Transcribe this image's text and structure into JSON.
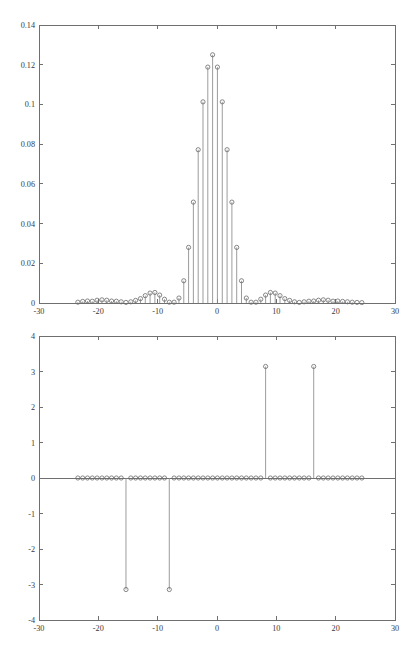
{
  "figure": {
    "name": "two-panel-stem-plot",
    "background": "#ffffff",
    "line_color": "#8a8a8a",
    "marker_color": "#6a6a6a",
    "axis_color": "#6f6f6f",
    "text_color": "#3a3a3a"
  },
  "chart_data": [
    {
      "type": "scatter",
      "plot_style": "stem",
      "title": "",
      "xlabel": "",
      "ylabel": "",
      "xlim": [
        -30,
        30
      ],
      "ylim": [
        0,
        0.14
      ],
      "grid": false,
      "legend": null,
      "xticks": [
        -30,
        -20,
        -10,
        0,
        10,
        20,
        30
      ],
      "xtick_labels": [
        "-30",
        "-20",
        "-10",
        "0",
        "10",
        "20",
        "30"
      ],
      "yticks": [
        0,
        0.02,
        0.04,
        0.06,
        0.08,
        0.1,
        0.12,
        0.14
      ],
      "ytick_labels": [
        "0",
        "0.02",
        "0.04",
        "0.06",
        "0.08",
        "0.1",
        "0.12",
        "0.14"
      ],
      "x": [
        -23.45,
        -22.64,
        -21.83,
        -21.02,
        -20.21,
        -19.39,
        -18.58,
        -17.77,
        -16.96,
        -16.15,
        -15.34,
        -14.53,
        -13.72,
        -12.9,
        -12.09,
        -11.28,
        -10.47,
        -9.66,
        -8.85,
        -8.04,
        -7.23,
        -6.41,
        -5.6,
        -4.79,
        -3.98,
        -3.17,
        -2.36,
        -1.55,
        -0.74,
        0.07,
        0.89,
        1.7,
        2.51,
        3.32,
        4.13,
        4.94,
        5.75,
        6.56,
        7.38,
        8.19,
        9.0,
        9.81,
        10.62,
        11.43,
        12.24,
        13.06,
        13.87,
        14.68,
        15.49,
        16.3,
        17.11,
        17.92,
        18.73,
        19.55,
        20.36,
        21.17,
        21.98,
        22.79,
        23.6,
        24.41
      ],
      "y": [
        0.0004,
        0.0008,
        0.001,
        0.0009,
        0.0014,
        0.0016,
        0.0014,
        0.001,
        0.0009,
        0.0006,
        0.0003,
        0.0006,
        0.0013,
        0.0022,
        0.0037,
        0.005,
        0.0053,
        0.004,
        0.0019,
        0.0004,
        0.0004,
        0.0025,
        0.0112,
        0.028,
        0.0508,
        0.0772,
        0.1013,
        0.1188,
        0.125,
        0.1188,
        0.1013,
        0.0772,
        0.0508,
        0.028,
        0.0112,
        0.0025,
        0.0004,
        0.0004,
        0.0019,
        0.004,
        0.0053,
        0.005,
        0.0037,
        0.0022,
        0.0013,
        0.0006,
        0.0003,
        0.0006,
        0.0009,
        0.001,
        0.0014,
        0.0016,
        0.0014,
        0.0009,
        0.001,
        0.0008,
        0.0006,
        0.0004,
        0.0003,
        0.0002
      ]
    },
    {
      "type": "scatter",
      "plot_style": "stem",
      "title": "",
      "xlabel": "",
      "ylabel": "",
      "xlim": [
        -30,
        30
      ],
      "ylim": [
        -4,
        4
      ],
      "grid": false,
      "legend": null,
      "xticks": [
        -30,
        -20,
        -10,
        0,
        10,
        20,
        30
      ],
      "xtick_labels": [
        "-30",
        "-20",
        "-10",
        "0",
        "10",
        "20",
        "30"
      ],
      "yticks": [
        -4,
        -3,
        -2,
        -1,
        0,
        1,
        2,
        3,
        4
      ],
      "ytick_labels": [
        "-4",
        "-3",
        "-2",
        "-1",
        "0",
        "1",
        "2",
        "3",
        "4"
      ],
      "x": [
        -23.45,
        -22.64,
        -21.83,
        -21.02,
        -20.21,
        -19.39,
        -18.58,
        -17.77,
        -16.96,
        -16.15,
        -15.34,
        -14.53,
        -13.72,
        -12.9,
        -12.09,
        -11.28,
        -10.47,
        -9.66,
        -8.85,
        -8.04,
        -7.23,
        -6.41,
        -5.6,
        -4.79,
        -3.98,
        -3.17,
        -2.36,
        -1.55,
        -0.74,
        0.07,
        0.89,
        1.7,
        2.51,
        3.32,
        4.13,
        4.94,
        5.75,
        6.56,
        7.38,
        8.19,
        9.0,
        9.81,
        10.62,
        11.43,
        12.24,
        13.06,
        13.87,
        14.68,
        15.49,
        16.3,
        17.11,
        17.92,
        18.73,
        19.55,
        20.36,
        21.17,
        21.98,
        22.79,
        23.6,
        24.41
      ],
      "y": [
        0,
        0,
        0,
        0,
        0,
        0,
        0,
        0,
        0,
        0,
        -3.1416,
        0,
        0,
        0,
        0,
        0,
        0,
        0,
        0,
        -3.1416,
        0,
        0,
        0,
        0,
        0,
        0,
        0,
        0,
        0,
        0,
        0,
        0,
        0,
        0,
        0,
        0,
        0,
        0,
        0,
        3.1416,
        0,
        0,
        0,
        0,
        0,
        0,
        0,
        0,
        0,
        3.1416,
        0,
        0,
        0,
        0,
        0,
        0,
        0,
        0,
        0,
        0
      ]
    }
  ]
}
